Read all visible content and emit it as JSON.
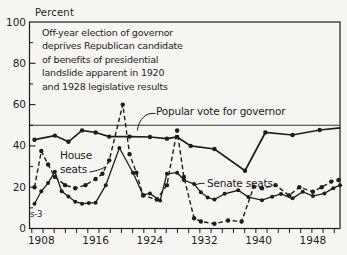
{
  "figure": {
    "y_axis_title": "Percent",
    "source_mark": "s-3",
    "annotation": [
      "Off-year election of governor",
      "deprives Republican candidate",
      "of benefits of presidential",
      "landslide apparent in 1920",
      "and 1928 legislative results"
    ],
    "series_labels": {
      "popular": "Popular vote for governor",
      "house_line1": "House",
      "house_line2": "seats",
      "senate": "Senate seats"
    },
    "ink_color": "#1d1d1b",
    "paper_color": "#f6f5f1"
  },
  "chart_data": {
    "type": "line",
    "xlabel": "",
    "ylabel": "Percent",
    "ylim": [
      0,
      100
    ],
    "xlim": [
      1906.2,
      1952
    ],
    "y_major_ticks": [
      0,
      20,
      40,
      60,
      80,
      100
    ],
    "y_minor_ticks": [
      10,
      30,
      50,
      70,
      90
    ],
    "x_labeled_ticks": [
      1908,
      1916,
      1924,
      1932,
      1940,
      1948
    ],
    "x_tick_start": 1906.6,
    "x_tick_step": 1.65,
    "x_tick_end": 1951.8,
    "reference_line_y": 50,
    "grid": "off",
    "series": [
      {
        "name": "Popular vote for governor",
        "style": "solid",
        "points": [
          [
            1907,
            43
          ],
          [
            1910,
            45
          ],
          [
            1912,
            42
          ],
          [
            1914,
            47.5
          ],
          [
            1916,
            46.5
          ],
          [
            1918,
            44.5
          ],
          [
            1921,
            44.5
          ],
          [
            1924,
            44.3
          ],
          [
            1926.5,
            43.5
          ],
          [
            1928,
            44.3
          ],
          [
            1930,
            40
          ],
          [
            1933.5,
            38.5
          ],
          [
            1938,
            28
          ],
          [
            1941,
            46.5
          ],
          [
            1945,
            45.3
          ],
          [
            1949,
            47.7
          ]
        ],
        "line_end": [
          1952,
          48.7
        ]
      },
      {
        "name": "House seats",
        "style": "dashed",
        "points": [
          [
            1907,
            20
          ],
          [
            1908,
            37.5
          ],
          [
            1909,
            31
          ],
          [
            1910,
            25
          ],
          [
            1911.5,
            21
          ],
          [
            1913,
            19.5
          ],
          [
            1914.5,
            21
          ],
          [
            1916,
            24
          ],
          [
            1917,
            26.5
          ],
          [
            1918,
            33
          ],
          [
            1920,
            60
          ],
          [
            1921,
            36
          ],
          [
            1922,
            27
          ],
          [
            1923,
            16
          ],
          [
            1925,
            14
          ],
          [
            1926.5,
            21
          ],
          [
            1928,
            47.5
          ],
          [
            1929,
            25
          ],
          [
            1930.5,
            5
          ],
          [
            1931.5,
            3.4
          ],
          [
            1933.5,
            2.3
          ],
          [
            1935.5,
            3.9
          ],
          [
            1937.5,
            3.4
          ],
          [
            1939.3,
            20.2
          ],
          [
            1940.5,
            19.5
          ],
          [
            1942.5,
            21
          ],
          [
            1944.5,
            16
          ],
          [
            1946,
            20
          ],
          [
            1948,
            17.8
          ],
          [
            1949.3,
            20
          ],
          [
            1950.7,
            22.7
          ],
          [
            1951.8,
            23.5
          ]
        ]
      },
      {
        "name": "Senate seats",
        "style": "solid-thin",
        "points": [
          [
            1907,
            12
          ],
          [
            1908,
            18
          ],
          [
            1909,
            22
          ],
          [
            1910,
            27.5
          ],
          [
            1911,
            18
          ],
          [
            1912,
            15.5
          ],
          [
            1913,
            13
          ],
          [
            1914,
            12
          ],
          [
            1915,
            12.3
          ],
          [
            1916,
            12.5
          ],
          [
            1917.5,
            21
          ],
          [
            1919.5,
            39
          ],
          [
            1921.5,
            27
          ],
          [
            1923,
            16.2
          ],
          [
            1924,
            17
          ],
          [
            1925.5,
            13.5
          ],
          [
            1926.5,
            26.5
          ],
          [
            1928,
            27
          ],
          [
            1929,
            23.5
          ],
          [
            1930.5,
            21.5
          ],
          [
            1931.5,
            17.5
          ],
          [
            1932.5,
            15
          ],
          [
            1933.5,
            14
          ],
          [
            1935,
            16.8
          ],
          [
            1937,
            18.5
          ],
          [
            1938.5,
            15.2
          ],
          [
            1940.5,
            13.7
          ],
          [
            1942,
            15.4
          ],
          [
            1943.3,
            16.7
          ],
          [
            1945,
            14.6
          ],
          [
            1946.5,
            17.8
          ],
          [
            1948,
            15.7
          ],
          [
            1949.7,
            17
          ],
          [
            1951,
            19.5
          ],
          [
            1952,
            21
          ]
        ]
      }
    ]
  }
}
